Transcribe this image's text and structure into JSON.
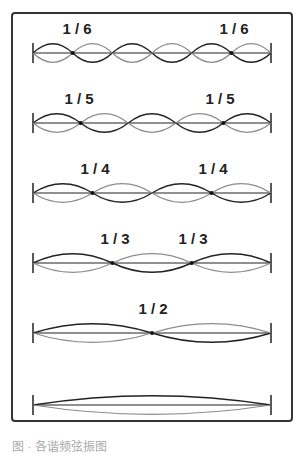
{
  "diagram": {
    "rows": [
      {
        "mode": 6,
        "labels": [
          "1 / 6",
          "1 / 6"
        ]
      },
      {
        "mode": 5,
        "labels": [
          "1 / 5",
          "1 / 5"
        ]
      },
      {
        "mode": 4,
        "labels": [
          "1 / 4",
          "1 / 4"
        ]
      },
      {
        "mode": 3,
        "labels": [
          "1 / 3",
          "1 / 3"
        ]
      },
      {
        "mode": 2,
        "labels": [
          "1 / 2"
        ]
      },
      {
        "mode": 1,
        "labels": []
      }
    ],
    "colors": {
      "dark_wave": "#222222",
      "light_wave": "#8c8c8c",
      "frame": "#333333"
    }
  },
  "caption": "图 · 各谐频弦振图"
}
